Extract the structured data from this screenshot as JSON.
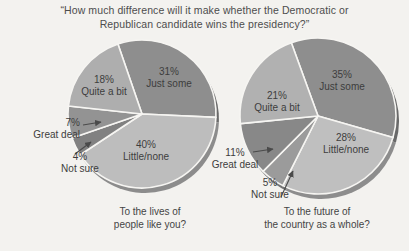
{
  "title": {
    "line1": "“How much difference will it make whether the Democratic or",
    "line2": "Republican candidate wins the presidency?”"
  },
  "chart_data": [
    {
      "type": "pie",
      "question": "To the lives of people like you?",
      "caption": [
        "To the lives of",
        "people like you?"
      ],
      "legend": "labels inside and beside slices",
      "slices": [
        {
          "label": "Just some",
          "value": 31,
          "pct_text": "31%",
          "color": "#8e8e8e"
        },
        {
          "label": "Little/none",
          "value": 40,
          "pct_text": "40%",
          "color": "#bdbdbd"
        },
        {
          "label": "Not sure",
          "value": 4,
          "pct_text": "4%",
          "color": "#818181"
        },
        {
          "label": "Great deal",
          "value": 7,
          "pct_text": "7%",
          "color": "#939393"
        },
        {
          "label": "Quite a bit",
          "value": 18,
          "pct_text": "18%",
          "color": "#aeaeae"
        }
      ]
    },
    {
      "type": "pie",
      "question": "To the future of the country as a whole?",
      "caption": [
        "To the future of",
        "the country as a whole?"
      ],
      "legend": "labels inside and beside slices",
      "slices": [
        {
          "label": "Just some",
          "value": 35,
          "pct_text": "35%",
          "color": "#8e8e8e"
        },
        {
          "label": "Little/none",
          "value": 28,
          "pct_text": "28%",
          "color": "#bfbfbf"
        },
        {
          "label": "Not sure",
          "value": 5,
          "pct_text": "5%",
          "color": "#9b9b9b"
        },
        {
          "label": "Great deal",
          "value": 11,
          "pct_text": "11%",
          "color": "#888888"
        },
        {
          "label": "Quite a bit",
          "value": 21,
          "pct_text": "21%",
          "color": "#b1b1b1"
        }
      ]
    }
  ],
  "style": {
    "background": "#f3f2ef",
    "slice_divider": "#f6f5f2",
    "arrow_color": "#4a4a4a",
    "text_color": "#3d3d3d"
  }
}
